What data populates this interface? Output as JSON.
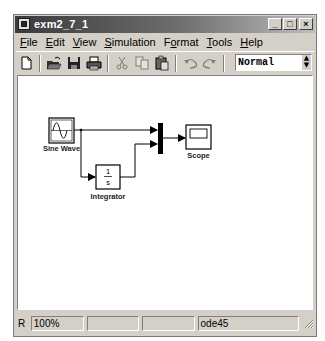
{
  "window": {
    "title": "exm2_7_1",
    "controls": {
      "minimize": "_",
      "maximize": "□",
      "close": "×"
    }
  },
  "menubar": {
    "items": [
      {
        "label": "File",
        "mnemonic": "F"
      },
      {
        "label": "Edit",
        "mnemonic": "E"
      },
      {
        "label": "View",
        "mnemonic": "V"
      },
      {
        "label": "Simulation",
        "mnemonic": "S"
      },
      {
        "label": "Format",
        "mnemonic": "o"
      },
      {
        "label": "Tools",
        "mnemonic": "T"
      },
      {
        "label": "Help",
        "mnemonic": "H"
      }
    ]
  },
  "toolbar": {
    "buttons": [
      {
        "name": "new-icon",
        "enabled": true
      },
      {
        "name": "open-icon",
        "enabled": true
      },
      {
        "name": "save-icon",
        "enabled": true
      },
      {
        "name": "print-icon",
        "enabled": true
      },
      {
        "name": "cut-icon",
        "enabled": false
      },
      {
        "name": "copy-icon",
        "enabled": false
      },
      {
        "name": "paste-icon",
        "enabled": true
      },
      {
        "name": "undo-icon",
        "enabled": false
      },
      {
        "name": "redo-icon",
        "enabled": false
      },
      {
        "name": "start-simulation-icon",
        "enabled": true
      },
      {
        "name": "stop-simulation-icon",
        "enabled": false
      }
    ],
    "simulation_mode": "Normal"
  },
  "diagram": {
    "blocks": [
      {
        "id": "sine",
        "label": "Sine Wave",
        "type": "source"
      },
      {
        "id": "integrator",
        "label": "Integrator",
        "type": "continuous",
        "numerator": "1",
        "denominator": "s"
      },
      {
        "id": "mux",
        "label": "",
        "type": "mux"
      },
      {
        "id": "scope",
        "label": "Scope",
        "type": "sink"
      }
    ],
    "signals": [
      {
        "from": "Sine Wave",
        "to": "Mux input 1"
      },
      {
        "from": "Sine Wave",
        "to": "Integrator"
      },
      {
        "from": "Integrator",
        "to": "Mux input 2"
      },
      {
        "from": "Mux",
        "to": "Scope"
      }
    ]
  },
  "statusbar": {
    "prefix": "R",
    "zoom": "100%",
    "cell2": "",
    "cell3": "",
    "solver": "ode45"
  }
}
